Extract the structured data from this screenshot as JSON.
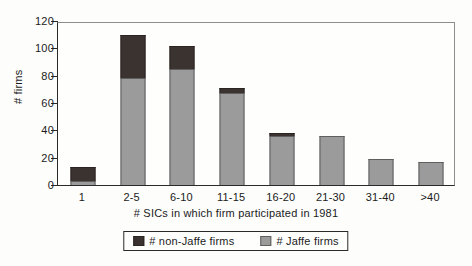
{
  "chart_data": {
    "type": "bar",
    "stacked": true,
    "title": "",
    "xlabel": "# SICs in which firm participated in 1981",
    "ylabel": "# firms",
    "categories": [
      "1",
      "2-5",
      "6-10",
      "11-15",
      "16-20",
      "21-30",
      "31-40",
      ">40"
    ],
    "series": [
      {
        "name": "# non-Jaffe firms",
        "color": "#3a3330",
        "values": [
          10,
          32,
          17,
          4,
          2,
          0,
          0,
          0
        ]
      },
      {
        "name": "# Jaffe firms",
        "color": "#9b9b9b",
        "values": [
          3,
          78,
          85,
          67,
          36,
          36,
          19,
          17
        ]
      }
    ],
    "totals": [
      13,
      110,
      102,
      71,
      38,
      36,
      19,
      17
    ],
    "ylim": [
      0,
      120
    ],
    "yticks": [
      "0",
      "20",
      "40",
      "60",
      "80",
      "100",
      "120"
    ],
    "ytick_values": [
      0,
      20,
      40,
      60,
      80,
      100,
      120
    ],
    "grid": false,
    "legend_position": "bottom-center"
  },
  "axes": {
    "y_title": "# firms",
    "x_title": "# SICs in which firm participated in 1981"
  },
  "legend": {
    "entries": [
      {
        "label": "# non-Jaffe firms",
        "swatch": "dark-swatch-icon"
      },
      {
        "label": "# Jaffe firms",
        "swatch": "gray-swatch-icon"
      }
    ]
  }
}
